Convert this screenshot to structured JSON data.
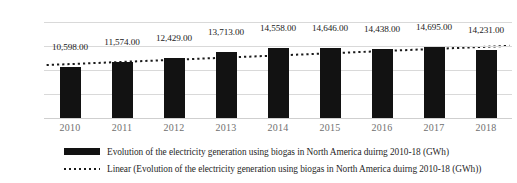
{
  "chart_data": {
    "type": "bar",
    "title": "",
    "xlabel": "",
    "ylabel": "",
    "categories": [
      "2010",
      "2011",
      "2012",
      "2013",
      "2014",
      "2015",
      "2016",
      "2017",
      "2018"
    ],
    "values": [
      10598,
      11574,
      12429,
      13713,
      14558,
      14646,
      14438,
      14695,
      14231
    ],
    "data_labels": [
      "10,598.00",
      "11,574.00",
      "12,429.00",
      "13,713.00",
      "14,558.00",
      "14,646.00",
      "14,438.00",
      "14,695.00",
      "14,231.00"
    ],
    "ylim": [
      0,
      20000
    ],
    "ytick_values": [
      0,
      5000,
      10000,
      15000,
      20000
    ],
    "ytick_labels": [
      "0",
      "5000",
      "10000",
      "15000",
      "20000"
    ],
    "grid": true,
    "legend_position": "bottom",
    "series": [
      {
        "name": "Evolution of the electricity generation using biogas in North America duirng 2010-18 (GWh)",
        "type": "bar",
        "color": "#121212",
        "values": [
          10598,
          11574,
          12429,
          13713,
          14558,
          14646,
          14438,
          14695,
          14231
        ]
      },
      {
        "name": "Linear (Evolution of the electricity generation using biogas in North America duirng 2010-18 (GWh))",
        "type": "trendline-linear",
        "style": "dotted",
        "color": "#1a1a1a",
        "endpoints": [
          11030,
          15040
        ]
      }
    ]
  },
  "legend": {
    "items": [
      {
        "marker": "bar-swatch",
        "label": "Evolution of the electricity generation using biogas in North America duirng 2010-18 (GWh)"
      },
      {
        "marker": "dotted-line-swatch",
        "label": "Linear (Evolution of the electricity generation using biogas in North America duirng 2010-18 (GWh))"
      }
    ]
  }
}
